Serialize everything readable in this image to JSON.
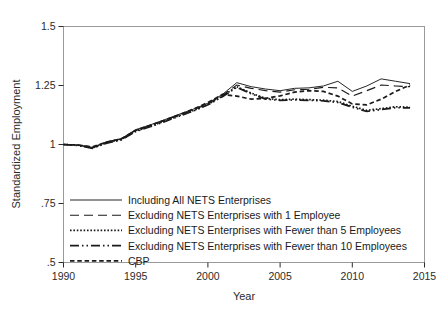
{
  "chart_data": {
    "type": "line",
    "title": "",
    "xlabel": "Year",
    "ylabel": "Standardized Employment",
    "xlim": [
      1990,
      2015
    ],
    "ylim": [
      0.5,
      1.5
    ],
    "xticks": [
      1990,
      1995,
      2000,
      2005,
      2010,
      2015
    ],
    "xticklabels": [
      "1990",
      "1995",
      "2000",
      "2005",
      "2010",
      "2015"
    ],
    "yticks": [
      0.5,
      0.75,
      1,
      1.25,
      1.5
    ],
    "yticklabels": [
      ".5",
      ".75",
      "1",
      "1.25",
      "1.5"
    ],
    "grid": false,
    "legend_position": "lower-left-inside",
    "line_color": "#1a1a1a",
    "x": [
      1990,
      1991,
      1992,
      1993,
      1994,
      1995,
      1996,
      1997,
      1998,
      1999,
      2000,
      2001,
      2002,
      2003,
      2004,
      2005,
      2006,
      2007,
      2008,
      2009,
      2010,
      2011,
      2012,
      2013,
      2014
    ],
    "series": [
      {
        "name": "Including All NETS Enterprises",
        "style": "solid",
        "values": [
          1.0,
          0.998,
          0.988,
          1.012,
          1.025,
          1.063,
          1.083,
          1.105,
          1.128,
          1.15,
          1.175,
          1.212,
          1.262,
          1.245,
          1.235,
          1.228,
          1.238,
          1.24,
          1.248,
          1.268,
          1.225,
          1.248,
          1.278,
          1.268,
          1.258
        ]
      },
      {
        "name": "Excluding NETS Enterprises with 1 Employee",
        "style": "dashed",
        "values": [
          1.0,
          0.998,
          0.986,
          1.01,
          1.023,
          1.06,
          1.08,
          1.102,
          1.125,
          1.147,
          1.172,
          1.208,
          1.252,
          1.238,
          1.228,
          1.222,
          1.232,
          1.234,
          1.242,
          1.24,
          1.205,
          1.228,
          1.252,
          1.248,
          1.245
        ]
      },
      {
        "name": "Excluding NETS Enterprises with Fewer than 5 Employees",
        "style": "dotted",
        "values": [
          1.0,
          0.997,
          0.985,
          1.008,
          1.021,
          1.057,
          1.077,
          1.099,
          1.122,
          1.144,
          1.17,
          1.205,
          1.245,
          1.218,
          1.195,
          1.19,
          1.192,
          1.19,
          1.188,
          1.182,
          1.162,
          1.145,
          1.152,
          1.16,
          1.158
        ]
      },
      {
        "name": "Excluding NETS Enterprises with Fewer than 10 Employees",
        "style": "dashdotdot",
        "values": [
          1.0,
          0.996,
          0.984,
          1.006,
          1.019,
          1.055,
          1.075,
          1.097,
          1.12,
          1.142,
          1.168,
          1.202,
          1.242,
          1.215,
          1.192,
          1.187,
          1.189,
          1.187,
          1.185,
          1.178,
          1.158,
          1.14,
          1.148,
          1.156,
          1.155
        ]
      },
      {
        "name": "CBP",
        "style": "shortdash",
        "values": [
          1.0,
          0.998,
          0.99,
          1.01,
          1.024,
          1.06,
          1.081,
          1.103,
          1.126,
          1.15,
          1.178,
          1.212,
          1.205,
          1.192,
          1.196,
          1.206,
          1.222,
          1.228,
          1.225,
          1.205,
          1.172,
          1.168,
          1.192,
          1.225,
          1.252
        ]
      }
    ]
  },
  "legend": {
    "entries": [
      {
        "label": "Including All NETS Enterprises",
        "style": "solid"
      },
      {
        "label": "Excluding NETS Enterprises with 1 Employee",
        "style": "dashed"
      },
      {
        "label": "Excluding NETS Enterprises with Fewer than 5 Employees",
        "style": "dotted"
      },
      {
        "label": "Excluding NETS Enterprises with Fewer than 10 Employees",
        "style": "dashdotdot"
      },
      {
        "label": "CBP",
        "style": "shortdash"
      }
    ]
  }
}
